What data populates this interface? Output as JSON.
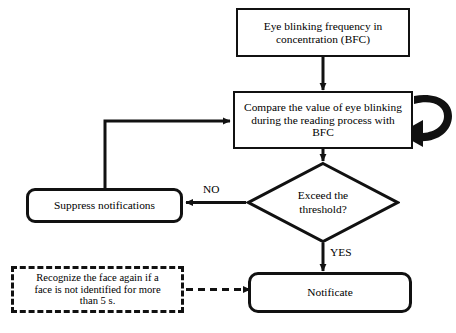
{
  "diagram": {
    "type": "flowchart",
    "colors": {
      "stroke": "#111111",
      "fill": "#ffffff",
      "text": "#000000"
    },
    "nodes": {
      "bfc": {
        "label": "Eye blinking frequency in\nconcentration (BFC)",
        "shape": "rectangle"
      },
      "compare": {
        "label": "Compare the value of eye blinking\nduring the reading process with\nBFC",
        "shape": "rectangle"
      },
      "decision": {
        "label": "Exceed the\nthreshold?",
        "shape": "diamond"
      },
      "suppress": {
        "label": "Suppress notifications",
        "shape": "rounded-rectangle"
      },
      "notificate": {
        "label": "Notificate",
        "shape": "rounded-rectangle"
      },
      "recognize": {
        "label": "Recognize the face again if a\nface is not identified for more\nthan 5 s.",
        "shape": "dashed-rectangle"
      }
    },
    "edge_labels": {
      "no": "NO",
      "yes": "YES"
    },
    "caption": ""
  }
}
